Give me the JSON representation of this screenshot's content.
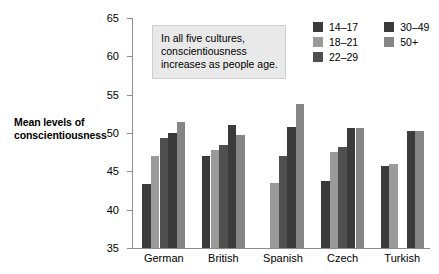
{
  "axis_title": {
    "line1": "Mean levels of",
    "line2": "conscientiousness"
  },
  "note": {
    "line1": "In all five cultures,",
    "line2": "conscientiousness",
    "line3": "increases as people age."
  },
  "legend": {
    "column1": [
      {
        "label": "14–17",
        "color": "#3b3b3b"
      },
      {
        "label": "18–21",
        "color": "#9a9a9a"
      },
      {
        "label": "22–29",
        "color": "#4f4f4f"
      }
    ],
    "column2": [
      {
        "label": "30–49",
        "color": "#3b3b3b"
      },
      {
        "label": "50+",
        "color": "#858585"
      }
    ]
  },
  "chart_data": {
    "type": "bar",
    "title": "",
    "subtitle": "",
    "xlabel": "",
    "ylabel": "Mean levels of conscientiousness",
    "ylim": [
      35,
      65
    ],
    "yticks": [
      35,
      40,
      45,
      50,
      55,
      60,
      65
    ],
    "grid": false,
    "legend_position": "top-right",
    "annotation": "In all five cultures, conscientiousness increases as people age.",
    "categories": [
      "German",
      "British",
      "Spanish",
      "Czech",
      "Turkish"
    ],
    "series": [
      {
        "name": "14–17",
        "color": "#3b3b3b",
        "values": [
          43.3,
          47.0,
          null,
          43.8,
          45.7
        ]
      },
      {
        "name": "18–21",
        "color": "#9a9a9a",
        "values": [
          47.0,
          47.8,
          43.5,
          47.5,
          45.9
        ]
      },
      {
        "name": "22–29",
        "color": "#4f4f4f",
        "values": [
          49.3,
          48.4,
          47.0,
          48.2,
          null
        ]
      },
      {
        "name": "30–49",
        "color": "#3b3b3b",
        "values": [
          50.0,
          51.0,
          50.8,
          50.7,
          50.2
        ]
      },
      {
        "name": "50+",
        "color": "#858585",
        "values": [
          51.5,
          49.7,
          53.8,
          50.7,
          50.2
        ]
      }
    ]
  }
}
